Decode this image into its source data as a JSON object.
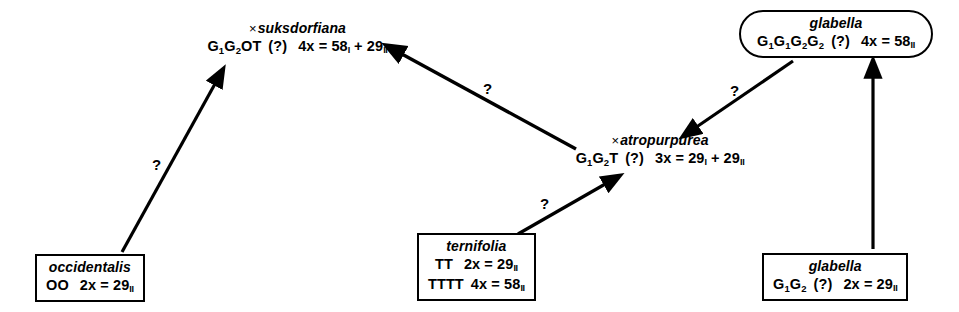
{
  "diagram": {
    "line_color": "#000000",
    "background": "#ffffff"
  },
  "nodes": {
    "suksdorfiana": {
      "name": "suksdorfiana",
      "hybrid_sign": "×",
      "genome": "G1G2OT",
      "uncertainty": "(?)",
      "ploidy": "4x",
      "equals": "=",
      "chromosomes": "58",
      "pairing": "I",
      "plus": "+",
      "chromosomes2": "29",
      "pairing2": "II",
      "style": "free"
    },
    "glabella_top": {
      "name": "glabella",
      "genome": "G1G1G2G2",
      "uncertainty": "(?)",
      "ploidy": "4x",
      "equals": "=",
      "chromosomes": "58",
      "pairing": "II",
      "style": "pill"
    },
    "atropurpurea": {
      "name": "atropurpurea",
      "hybrid_sign": "×",
      "genome": "G1G2T",
      "uncertainty": "(?)",
      "ploidy": "3x",
      "equals": "=",
      "chromosomes": "29",
      "pairing": "I",
      "plus": "+",
      "chromosomes2": "29",
      "pairing2": "II",
      "style": "free"
    },
    "occidentalis": {
      "name": "occidentalis",
      "genome": "OO",
      "ploidy": "2x",
      "equals": "=",
      "chromosomes": "29",
      "pairing": "II",
      "style": "boxed"
    },
    "ternifolia": {
      "name": "ternifolia",
      "row1_genome": "TT",
      "row1_ploidy": "2x",
      "row1_equals": "=",
      "row1_chromosomes": "29",
      "row1_pairing": "II",
      "row2_genome": "TTTT",
      "row2_ploidy": "4x",
      "row2_equals": "=",
      "row2_chromosomes": "58",
      "row2_pairing": "II",
      "style": "boxed"
    },
    "glabella_bottom": {
      "name": "glabella",
      "genome": "G1G2",
      "uncertainty": "(?)",
      "ploidy": "2x",
      "equals": "=",
      "chromosomes": "29",
      "pairing": "II",
      "style": "boxed"
    }
  },
  "arrows": [
    {
      "id": "occidentalis-to-suksdorfiana",
      "from": "occidentalis",
      "to": "suksdorfiana",
      "label": "?",
      "label_x": 152,
      "label_y": 164
    },
    {
      "id": "atropurpurea-to-suksdorfiana",
      "from": "atropurpurea",
      "to": "suksdorfiana",
      "label": "?",
      "label_x": 483,
      "label_y": 88
    },
    {
      "id": "glabella-top-to-atropurpurea",
      "from": "glabella_top",
      "to": "atropurpurea",
      "label": "?",
      "label_x": 730,
      "label_y": 90
    },
    {
      "id": "ternifolia-to-atropurpurea",
      "from": "ternifolia",
      "to": "atropurpurea",
      "label": "?",
      "label_x": 540,
      "label_y": 203
    },
    {
      "id": "glabella-bottom-to-glabella-top",
      "from": "glabella_bottom",
      "to": "glabella_top",
      "label": "",
      "label_x": 0,
      "label_y": 0
    }
  ]
}
